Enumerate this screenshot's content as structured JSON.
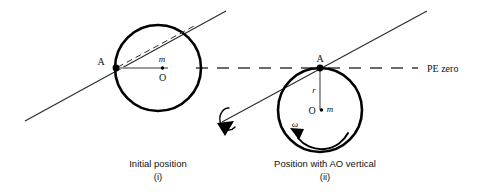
{
  "figure": {
    "colors": {
      "ink": "#111111",
      "circle_stroke": "#000000",
      "thin_line": "#2a2a2a",
      "radius_gray": "#9a9a9a",
      "background": "#ffffff"
    },
    "panels": [
      {
        "id": "panel-initial",
        "caption": "Initial position",
        "enumeration": "(i)",
        "circle": {
          "cx": 158,
          "cy": 68,
          "r": 43
        },
        "point_a_label": "A",
        "center_label": "O",
        "mass_label": "m",
        "radius_label": "",
        "omega_label": ""
      },
      {
        "id": "panel-vertical",
        "caption": "Position with AO vertical",
        "enumeration": "(ii)",
        "circle": {
          "cx": 320,
          "cy": 110,
          "r": 42
        },
        "point_a_label": "A",
        "center_label": "O",
        "mass_label": "m",
        "radius_label": "r",
        "omega_label": "ω"
      }
    ],
    "datum_line": {
      "label": "PE zero",
      "y": 68,
      "style": "dashed"
    },
    "axis_line": {
      "label": "",
      "style": "solid-inclined"
    },
    "rotation_arrow": {
      "label": "",
      "description": "curl-arrow"
    }
  }
}
